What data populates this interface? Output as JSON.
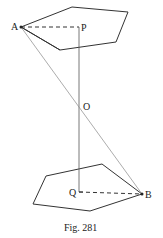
{
  "figure": {
    "caption": "Fig. 281",
    "labels": {
      "A": "A",
      "P": "P",
      "O": "O",
      "Q": "Q",
      "B": "B"
    }
  },
  "geometry": {
    "top_pentagon": [
      [
        21,
        27
      ],
      [
        72,
        7
      ],
      [
        128,
        12
      ],
      [
        116,
        42
      ],
      [
        60,
        50
      ]
    ],
    "bottom_pentagon": [
      [
        46,
        176
      ],
      [
        102,
        164
      ],
      [
        142,
        194
      ],
      [
        90,
        211
      ],
      [
        33,
        204
      ]
    ],
    "point_A": [
      21,
      27
    ],
    "point_P": [
      79,
      27
    ],
    "point_O": [
      79,
      104
    ],
    "point_Q": [
      79,
      192
    ],
    "point_B": [
      142,
      194
    ]
  },
  "colors": {
    "line": "#333333",
    "faint_line": "#777777"
  }
}
